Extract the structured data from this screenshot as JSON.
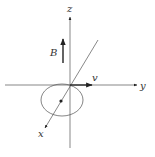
{
  "diagram": {
    "type": "3d-axes-physics",
    "labels": {
      "z_axis": "z",
      "y_axis": "y",
      "x_axis": "x",
      "magnetic_field": "B",
      "velocity": "v"
    },
    "colors": {
      "line": "#555555",
      "arrow": "#222222",
      "text": "#333333",
      "background": "#ffffff"
    },
    "elements": [
      {
        "name": "z-axis",
        "from": [
          70,
          148
        ],
        "to": [
          70,
          17
        ],
        "arrow": true
      },
      {
        "name": "y-axis",
        "from": [
          5,
          85
        ],
        "to": [
          137,
          85
        ],
        "arrow": true
      },
      {
        "name": "x-axis",
        "from": [
          98,
          40
        ],
        "to": [
          45,
          128
        ],
        "arrow": true
      },
      {
        "name": "orbit-ellipse",
        "center": [
          62,
          100
        ],
        "rx": 21,
        "ry": 16
      },
      {
        "name": "charge-dot",
        "center": [
          61,
          101
        ]
      },
      {
        "name": "velocity-vector",
        "from": [
          70,
          85
        ],
        "to": [
          92,
          85
        ]
      },
      {
        "name": "field-vector",
        "from": [
          63,
          63
        ],
        "to": [
          63,
          39
        ]
      }
    ]
  }
}
